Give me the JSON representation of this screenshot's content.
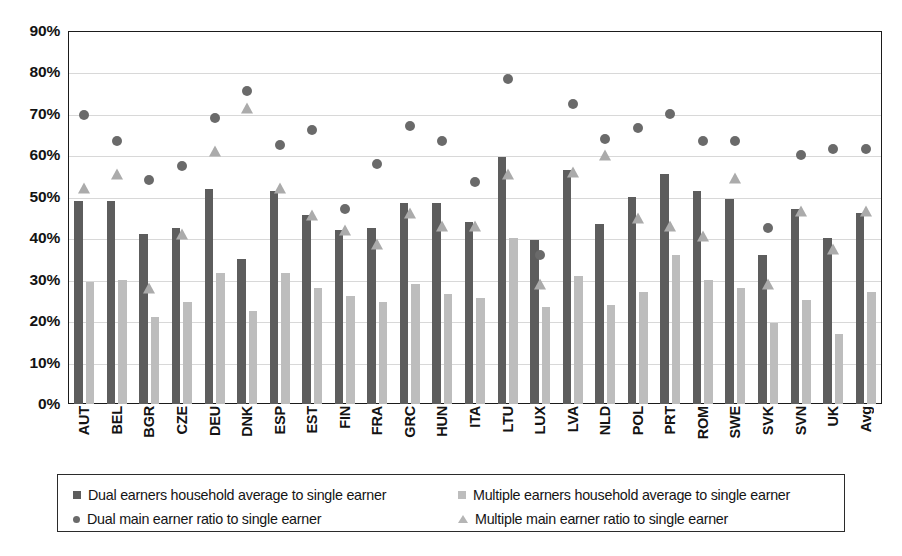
{
  "chart_data": {
    "type": "bar",
    "title": "",
    "subtitle": "",
    "xlabel": "",
    "ylabel": "",
    "ylim": [
      0,
      90
    ],
    "ytick_step": 10,
    "ytick_labels": [
      "0%",
      "10%",
      "20%",
      "30%",
      "40%",
      "50%",
      "60%",
      "70%",
      "80%",
      "90%"
    ],
    "grid": true,
    "legend_position": "bottom",
    "categories": [
      "AUT",
      "BEL",
      "BGR",
      "CZE",
      "DEU",
      "DNK",
      "ESP",
      "EST",
      "FIN",
      "FRA",
      "GRC",
      "HUN",
      "ITA",
      "LTU",
      "LUX",
      "LVA",
      "NLD",
      "POL",
      "PRT",
      "ROM",
      "SWE",
      "SVK",
      "SVN",
      "UK",
      "Avg"
    ],
    "series": [
      {
        "name": "Dual earners household average to single earner",
        "marker": "bar",
        "color": "#5d5d5d",
        "values": [
          49.0,
          49.0,
          41.0,
          42.5,
          52.0,
          35.0,
          51.5,
          45.5,
          42.0,
          42.5,
          48.5,
          48.5,
          44.0,
          59.5,
          39.5,
          56.5,
          43.5,
          50.0,
          55.5,
          51.5,
          49.5,
          36.0,
          47.0,
          40.0,
          46.0
        ]
      },
      {
        "name": "Multiple earners household average to single earner",
        "marker": "bar",
        "color": "#bdbdbd",
        "values": [
          29.5,
          30.0,
          21.0,
          24.5,
          31.5,
          22.5,
          31.5,
          28.0,
          26.0,
          24.5,
          29.0,
          26.5,
          25.5,
          40.0,
          23.5,
          31.0,
          24.0,
          27.0,
          36.0,
          30.0,
          28.0,
          19.5,
          25.0,
          17.0,
          27.0
        ]
      },
      {
        "name": "Dual main earner ratio to single earner",
        "marker": "circle",
        "color": "#6a6a6a",
        "values": [
          69.8,
          63.5,
          54.0,
          57.5,
          69.0,
          75.5,
          62.5,
          66.0,
          47.0,
          58.0,
          67.0,
          63.5,
          53.5,
          78.5,
          36.0,
          72.5,
          64.0,
          66.5,
          70.0,
          63.5,
          63.5,
          42.5,
          60.0,
          61.5,
          61.5
        ]
      },
      {
        "name": "Multiple main earner ratio to single earner",
        "marker": "triangle",
        "color": "#ababab",
        "values": [
          52.0,
          55.5,
          28.0,
          41.0,
          61.0,
          71.5,
          52.0,
          45.5,
          42.0,
          38.5,
          46.0,
          43.0,
          43.0,
          55.5,
          29.0,
          56.0,
          60.0,
          45.0,
          43.0,
          40.5,
          54.5,
          29.0,
          46.5,
          37.5,
          46.5
        ]
      }
    ]
  },
  "legend": {
    "items": [
      {
        "label": "Dual earners household average to single earner",
        "swatch": "square-dark-icon"
      },
      {
        "label": "Multiple earners household average to single earner",
        "swatch": "square-light-icon"
      },
      {
        "label": "Dual main earner ratio to single earner",
        "swatch": "circle-dark-icon"
      },
      {
        "label": "Multiple main earner ratio to single earner",
        "swatch": "triangle-light-icon"
      }
    ]
  }
}
